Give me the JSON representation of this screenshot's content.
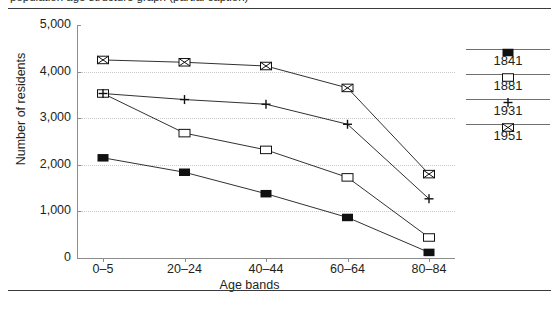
{
  "page": {
    "cut_caption": "population age structure graph (partial caption)"
  },
  "chart_data": {
    "type": "line",
    "title": "",
    "xlabel": "Age bands",
    "ylabel": "Number of residents",
    "categories": [
      "0–5",
      "20–24",
      "40–44",
      "60–64",
      "80–84"
    ],
    "ylim": [
      0,
      5000
    ],
    "ytick_labels": [
      "5,000",
      "4,000",
      "3,000",
      "2,000",
      "1,000",
      "0"
    ],
    "ytick_values": [
      5000,
      4000,
      3000,
      2000,
      1000,
      0
    ],
    "grid": "horizontal-dotted",
    "legend_position": "right",
    "series": [
      {
        "name": "1841",
        "marker": "filled-square",
        "values": [
          2150,
          1840,
          1380,
          870,
          120
        ]
      },
      {
        "name": "1881",
        "marker": "open-square",
        "values": [
          3530,
          2680,
          2320,
          1730,
          440
        ]
      },
      {
        "name": "1931",
        "marker": "plus",
        "values": [
          3530,
          3400,
          3300,
          2870,
          1270
        ]
      },
      {
        "name": "1951",
        "marker": "crossed-square",
        "values": [
          4250,
          4200,
          4120,
          3650,
          1800
        ]
      }
    ]
  },
  "colors": {
    "line": "#1a1a1a",
    "axis": "#8d8d8d",
    "grid": "#c9c9c9",
    "text": "#231f20",
    "rule": "#3b3b3b"
  }
}
